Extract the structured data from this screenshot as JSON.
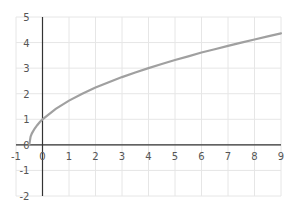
{
  "chart_data": {
    "type": "line",
    "title": "",
    "xlabel": "",
    "ylabel": "",
    "xlim": [
      -1,
      9
    ],
    "ylim": [
      -2,
      5
    ],
    "x_ticks": [
      -1,
      0,
      1,
      2,
      3,
      4,
      5,
      6,
      7,
      8,
      9
    ],
    "y_ticks": [
      -2,
      -1,
      0,
      1,
      2,
      3,
      4,
      5
    ],
    "grid": true,
    "legend": null,
    "series": [
      {
        "name": "y = sqrt(2x+1)",
        "color": "#a0a0a0",
        "x": [
          -0.5,
          -0.45,
          -0.4,
          -0.3,
          -0.2,
          -0.1,
          0,
          0.5,
          1,
          1.5,
          2,
          2.5,
          3,
          3.5,
          4,
          4.5,
          5,
          5.5,
          6,
          6.5,
          7,
          7.5,
          8,
          8.5,
          9
        ],
        "y": [
          0,
          0.32,
          0.45,
          0.63,
          0.77,
          0.89,
          1,
          1.41,
          1.73,
          2,
          2.24,
          2.45,
          2.65,
          2.83,
          3,
          3.16,
          3.32,
          3.46,
          3.61,
          3.74,
          3.87,
          4,
          4.12,
          4.24,
          4.36
        ]
      }
    ]
  },
  "colors": {
    "axis": "#333333",
    "grid": "#e6e6e6",
    "curve": "#a0a0a0"
  }
}
